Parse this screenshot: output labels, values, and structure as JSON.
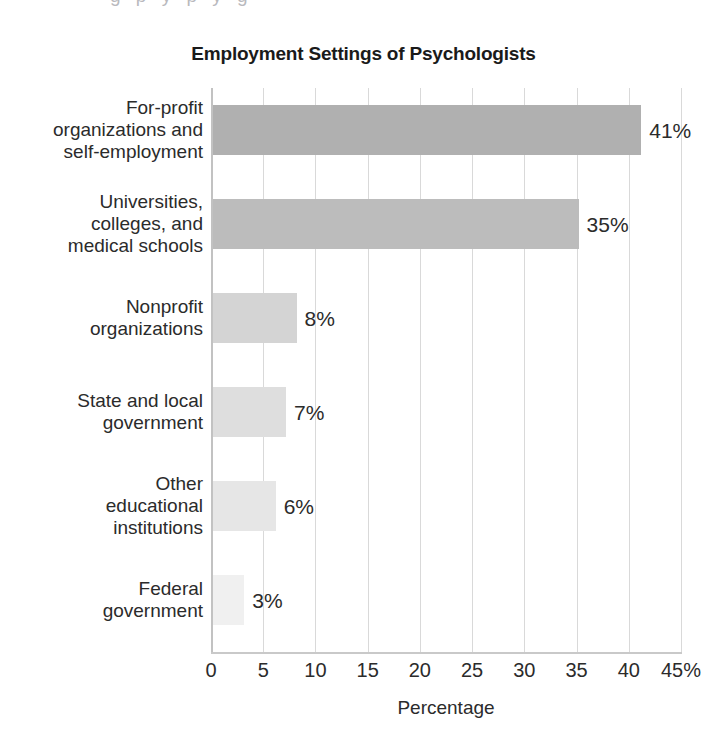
{
  "chart_data": {
    "type": "bar",
    "orientation": "horizontal",
    "title": "Employment Settings of Psychologists",
    "xlabel": "Percentage",
    "ylabel": "",
    "xlim": [
      0,
      45
    ],
    "grid": true,
    "legend": false,
    "categories": [
      "For-profit organizations and self-employment",
      "Universities, colleges, and medical schools",
      "Nonprofit organizations",
      "State and local government",
      "Other educational institutions",
      "Federal government"
    ],
    "category_lines": [
      [
        "For-profit",
        "organizations and",
        "self-employment"
      ],
      [
        "Universities,",
        "colleges, and",
        "medical schools"
      ],
      [
        "Nonprofit",
        "organizations"
      ],
      [
        "State and local",
        "government"
      ],
      [
        "Other",
        "educational",
        "institutions"
      ],
      [
        "Federal",
        "government"
      ]
    ],
    "values": [
      41,
      35,
      8,
      7,
      6,
      3
    ],
    "value_labels": [
      "41%",
      "35%",
      "8%",
      "7%",
      "6%",
      "3%"
    ],
    "bar_colors": [
      "#b0b0b0",
      "#bcbcbc",
      "#d4d4d4",
      "#dedede",
      "#e6e6e6",
      "#f0f0f0"
    ],
    "xticks": [
      0,
      5,
      10,
      15,
      20,
      25,
      30,
      35,
      40,
      45
    ],
    "xtick_labels": [
      "0",
      "5",
      "10",
      "15",
      "20",
      "25",
      "30",
      "35",
      "40",
      "45%"
    ]
  },
  "page": {
    "top_sliver_text": "g p y p y g"
  }
}
